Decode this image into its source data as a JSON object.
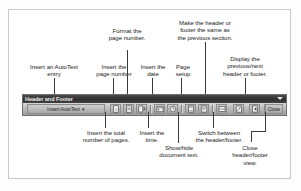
{
  "toolbar": {
    "title": "Header and Footer",
    "autotext_label": "Insert AutoText",
    "autotext_arrow": "▾",
    "menu_arrow_icon": "toolbar-options-chevron",
    "close_label": "Close",
    "buttons": [
      {
        "name": "insert-page-number",
        "icon": "page-number-icon"
      },
      {
        "name": "insert-number-of-pages",
        "icon": "number-of-pages-icon"
      },
      {
        "name": "format-page-number",
        "icon": "format-page-number-icon"
      },
      {
        "name": "insert-date",
        "icon": "calendar-icon"
      },
      {
        "name": "insert-time",
        "icon": "clock-icon"
      },
      {
        "name": "page-setup",
        "icon": "page-setup-icon"
      },
      {
        "name": "show-hide-document-text",
        "icon": "show-hide-text-icon"
      },
      {
        "name": "same-as-previous",
        "icon": "link-to-previous-icon"
      },
      {
        "name": "switch-header-footer",
        "icon": "switch-header-footer-icon"
      },
      {
        "name": "show-previous",
        "icon": "show-previous-icon"
      },
      {
        "name": "show-next",
        "icon": "show-next-icon"
      }
    ]
  },
  "callouts": {
    "top": [
      {
        "id": "autotext",
        "text": "Insert an AutoText\nentry"
      },
      {
        "id": "page-number",
        "text": "Insert the\npage number"
      },
      {
        "id": "format-page-number",
        "text": "Format the\npage number."
      },
      {
        "id": "date",
        "text": "Insert the\ndate"
      },
      {
        "id": "page-setup",
        "text": "Page\nsetup"
      },
      {
        "id": "same-as-previous",
        "text": "Make the header or\nfooter the same as\nthe previous section."
      },
      {
        "id": "previous-next",
        "text": "Display the\nprevious/next\nheader or footer."
      }
    ],
    "bottom": [
      {
        "id": "total-pages",
        "text": "Insert the total\nnumber of pages."
      },
      {
        "id": "time",
        "text": "Insert the\ntime."
      },
      {
        "id": "show-hide",
        "text": "Show/hide\ndocument text."
      },
      {
        "id": "switch",
        "text": "Switch between\nthe header/footer."
      },
      {
        "id": "close",
        "text": "Close\nheader/footer\nview."
      }
    ]
  },
  "colors": {
    "frame": "#c9c9c9",
    "titlebar": "#2f2f2f",
    "toolbar_face": "#bcbcbc",
    "leader": "#3a3a3a",
    "text": "#1b1b1b"
  }
}
